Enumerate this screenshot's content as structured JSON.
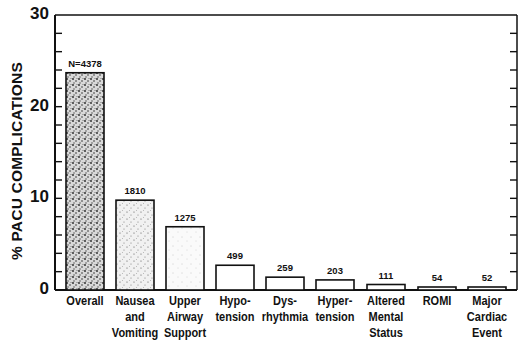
{
  "chart_data": {
    "type": "bar",
    "title": "",
    "xlabel": "",
    "ylabel": "% PACU COMPLICATIONS",
    "ylim": [
      0,
      30
    ],
    "yticks": [
      0,
      10,
      20,
      30
    ],
    "yminor_tick_step": 2,
    "grid": false,
    "legend": null,
    "categories": [
      "Overall",
      "Nausea and Vomiting",
      "Upper Airway Support",
      "Hypotension",
      "Dysrhythmia",
      "Hypertension",
      "Altered Mental Status",
      "ROMI",
      "Major Cardiac Event"
    ],
    "category_lines": [
      [
        "Overall"
      ],
      [
        "Nausea",
        "and",
        "Vomiting"
      ],
      [
        "Upper",
        "Airway",
        "Support"
      ],
      [
        "Hypo-",
        "tension"
      ],
      [
        "Dys-",
        "rhythmia"
      ],
      [
        "Hyper-",
        "tension"
      ],
      [
        "Altered",
        "Mental",
        "Status"
      ],
      [
        "ROMI"
      ],
      [
        "Major",
        "Cardiac",
        "Event"
      ]
    ],
    "values": [
      23.7,
      9.8,
      6.9,
      2.7,
      1.4,
      1.1,
      0.6,
      0.3,
      0.3
    ],
    "counts": [
      4378,
      1810,
      1275,
      499,
      259,
      203,
      111,
      54,
      52
    ],
    "bar_labels": [
      "N=4378",
      "1810",
      "1275",
      "499",
      "259",
      "203",
      "111",
      "54",
      "52"
    ],
    "fill_density": [
      "dense",
      "medium",
      "light",
      "none",
      "none",
      "none",
      "none",
      "none",
      "none"
    ]
  },
  "colors": {
    "ink": "#111111",
    "background": "#ffffff"
  }
}
